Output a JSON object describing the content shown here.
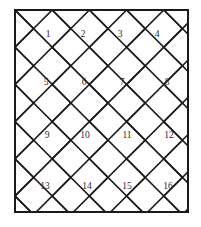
{
  "figure": {
    "background_color": "#ffffff",
    "line_color": "#1c1c1c",
    "frame_color": "#1a1a1a",
    "label_color": "#2b2b2b"
  },
  "frame": {
    "x": 14,
    "y": 9,
    "width": 175,
    "height": 204,
    "stroke_width": 2
  },
  "tiles": [
    {
      "id": 1,
      "label": "1",
      "row": 1,
      "col": 1,
      "cx": 48,
      "cy": 35
    },
    {
      "id": 2,
      "label": "2",
      "row": 1,
      "col": 2,
      "cx": 83,
      "cy": 35
    },
    {
      "id": 3,
      "label": "3",
      "row": 1,
      "col": 3,
      "cx": 120,
      "cy": 35
    },
    {
      "id": 4,
      "label": "4",
      "row": 1,
      "col": 4,
      "cx": 157,
      "cy": 35
    },
    {
      "id": 5,
      "label": "5",
      "row": 2,
      "col": 1,
      "cx": 46,
      "cy": 83
    },
    {
      "id": 6,
      "label": "6",
      "row": 2,
      "col": 2,
      "cx": 84,
      "cy": 83
    },
    {
      "id": 7,
      "label": "7",
      "row": 2,
      "col": 3,
      "cx": 122,
      "cy": 83
    },
    {
      "id": 8,
      "label": "8",
      "row": 2,
      "col": 4,
      "cx": 167,
      "cy": 83
    },
    {
      "id": 9,
      "label": "9",
      "row": 3,
      "col": 1,
      "cx": 47,
      "cy": 136
    },
    {
      "id": 10,
      "label": "10",
      "row": 3,
      "col": 2,
      "cx": 85,
      "cy": 136
    },
    {
      "id": 11,
      "label": "11",
      "row": 3,
      "col": 3,
      "cx": 127,
      "cy": 136
    },
    {
      "id": 12,
      "label": "12",
      "row": 3,
      "col": 4,
      "cx": 169,
      "cy": 136
    },
    {
      "id": 13,
      "label": "13",
      "row": 4,
      "col": 1,
      "cx": 45,
      "cy": 187
    },
    {
      "id": 14,
      "label": "14",
      "row": 4,
      "col": 2,
      "cx": 87,
      "cy": 187
    },
    {
      "id": 15,
      "label": "15",
      "row": 4,
      "col": 3,
      "cx": 127,
      "cy": 187
    },
    {
      "id": 16,
      "label": "16",
      "row": 4,
      "col": 4,
      "cx": 168,
      "cy": 187
    }
  ],
  "strokes": [
    {
      "name": "chevron-r1-c1",
      "points": "14,30 27,43 14,56"
    },
    {
      "name": "edge-r1-a",
      "points": "30,9 66,45 53,58"
    },
    {
      "name": "chevron-r1-c2",
      "points": "53,58 66,45 53,32 66,19 79,32 66,45"
    },
    {
      "name": "placeholder",
      "points": ""
    }
  ],
  "lines": {
    "description": "Diagonal lattice at plus and minus 45 degrees forming chevron tiles",
    "spacing": 37,
    "angle_degrees": 45
  }
}
